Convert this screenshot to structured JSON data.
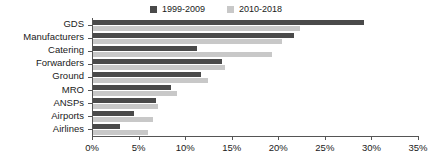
{
  "chart_data": {
    "type": "bar",
    "orientation": "horizontal",
    "title": "",
    "xlabel": "",
    "ylabel": "",
    "xlim": [
      0,
      35
    ],
    "xticks": [
      "0%",
      "5%",
      "10%",
      "15%",
      "20%",
      "25%",
      "30%",
      "35%"
    ],
    "xtick_values": [
      0,
      5,
      10,
      15,
      20,
      25,
      30,
      35
    ],
    "grid": false,
    "legend_position": "top-center",
    "categories": [
      "GDS",
      "Manufacturers",
      "Catering",
      "Forwarders",
      "Ground",
      "MRO",
      "ANSPs",
      "Airports",
      "Airlines"
    ],
    "series": [
      {
        "name": "1999-2009",
        "color": "#4a4a4a",
        "values": [
          29.1,
          21.6,
          11.2,
          13.9,
          11.6,
          8.4,
          6.8,
          4.4,
          2.9
        ]
      },
      {
        "name": "2010-2018",
        "color": "#c8c8c8",
        "values": [
          22.2,
          20.3,
          19.2,
          14.2,
          12.3,
          9.0,
          7.0,
          6.4,
          5.9
        ]
      }
    ]
  },
  "legend": {
    "entries": [
      {
        "label": "1999-2009",
        "swatch_color": "#4a4a4a"
      },
      {
        "label": "2010-2018",
        "swatch_color": "#c8c8c8"
      }
    ]
  },
  "axis": {
    "x_tick_labels": [
      "0%",
      "5%",
      "10%",
      "15%",
      "20%",
      "25%",
      "30%",
      "35%"
    ],
    "category_labels": [
      "GDS",
      "Manufacturers",
      "Catering",
      "Forwarders",
      "Ground",
      "MRO",
      "ANSPs",
      "Airports",
      "Airlines"
    ]
  }
}
